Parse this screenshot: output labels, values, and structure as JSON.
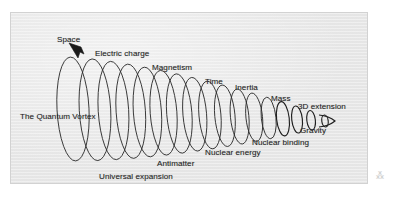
{
  "figure": {
    "title": "The Quantum Vortex",
    "background_color": "#e9e9e9",
    "page_color": "#ffffff",
    "border_color": "#d2d2d2",
    "stroke_color": "#2b2b2b",
    "text_color": "#262626",
    "speck_glyph": "⁂"
  },
  "labels": [
    {
      "id": "space",
      "text": "Space",
      "x": 46,
      "y": 22
    },
    {
      "id": "electric-charge",
      "text": "Electric charge",
      "x": 84,
      "y": 36
    },
    {
      "id": "magnetism",
      "text": "Magnetism",
      "x": 141,
      "y": 50
    },
    {
      "id": "time",
      "text": "Time",
      "x": 194,
      "y": 64
    },
    {
      "id": "inertia",
      "text": "Inertia",
      "x": 224,
      "y": 70
    },
    {
      "id": "mass",
      "text": "Mass",
      "x": 260,
      "y": 81
    },
    {
      "id": "three-d-extension",
      "text": "3D extension",
      "x": 287,
      "y": 89
    },
    {
      "id": "gravity",
      "text": "Gravity",
      "x": 289,
      "y": 113
    },
    {
      "id": "nuclear-binding",
      "text": "Nuclear binding",
      "x": 241,
      "y": 125
    },
    {
      "id": "nuclear-energy",
      "text": "Nuclear energy",
      "x": 194,
      "y": 135
    },
    {
      "id": "antimatter",
      "text": "Antimatter",
      "x": 146,
      "y": 146
    },
    {
      "id": "quantum-vortex",
      "text": "The Quantum Vortex",
      "x": 9,
      "y": 99
    },
    {
      "id": "universal-expansion",
      "text": "Universal expansion",
      "x": 88,
      "y": 159
    },
    {
      "id": "strangeness",
      "text": "Strangeness",
      "x": 47,
      "y": 173
    }
  ],
  "spiral": {
    "description": "Conical helix of nested ellipses shrinking from left to right",
    "loop_count": 17,
    "start_x": 62,
    "end_x": 314,
    "start_center_y": 96,
    "end_center_y": 108,
    "start_radius_x": 16,
    "start_radius_y": 52,
    "end_radius_x": 3.2,
    "end_radius_y": 6
  },
  "arrow": {
    "id": "space-pointer",
    "description": "Solid arrowhead pointing down-left from the Space label toward the first loop",
    "points": "70,34 58,30 67,45 69,39 73,41"
  }
}
